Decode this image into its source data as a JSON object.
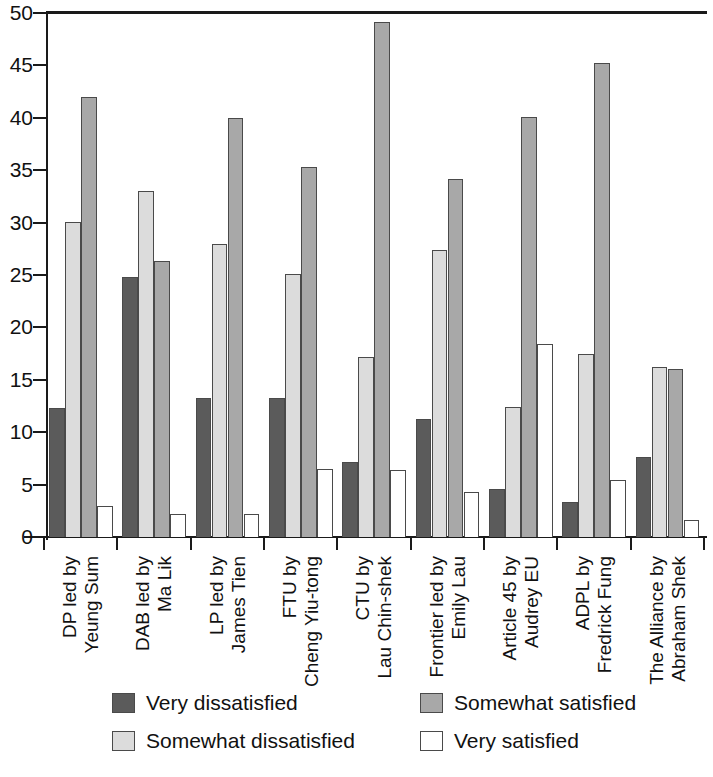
{
  "chart_data": {
    "type": "bar",
    "title": "",
    "xlabel": "",
    "ylabel": "",
    "ylim": [
      0,
      50
    ],
    "yticks": [
      0,
      5,
      10,
      15,
      20,
      25,
      30,
      35,
      40,
      45,
      50
    ],
    "grid": false,
    "legend_position": "bottom",
    "categories": [
      "DP led by\nYeung Sum",
      "DAB led by\nMa Lik",
      "LP led by\nJames Tien",
      "FTU by\nCheng Yiu-tong",
      "CTU by\nLau Chin-shek",
      "Frontier led by\nEmily Lau",
      "Article 45 by\nAudrey EU",
      "ADPL by\nFredrick Fung",
      "The Alliance by\nAbraham Shek"
    ],
    "series": [
      {
        "name": "Very dissatisfied",
        "color": "#5b5b5b",
        "values": [
          12.3,
          24.8,
          13.3,
          13.3,
          7.2,
          11.3,
          4.6,
          3.3,
          7.6
        ]
      },
      {
        "name": "Somewhat dissatisfied",
        "color": "#dcdcdc",
        "values": [
          30.1,
          33.0,
          28.0,
          25.1,
          17.2,
          27.4,
          12.4,
          17.5,
          16.2
        ]
      },
      {
        "name": "Somewhat satisfied",
        "color": "#a8a8a8",
        "values": [
          42.0,
          26.3,
          40.0,
          35.3,
          49.1,
          34.2,
          40.1,
          45.2,
          16.0
        ]
      },
      {
        "name": "Very satisfied",
        "color": "#ffffff",
        "values": [
          3.0,
          2.2,
          2.2,
          6.5,
          6.4,
          4.3,
          18.4,
          5.4,
          1.6
        ]
      }
    ]
  },
  "legend": {
    "items": [
      {
        "label": "Very dissatisfied",
        "color": "#5b5b5b"
      },
      {
        "label": "Somewhat satisfied",
        "color": "#a8a8a8"
      },
      {
        "label": "Somewhat dissatisfied",
        "color": "#dcdcdc"
      },
      {
        "label": "Very satisfied",
        "color": "#ffffff"
      }
    ]
  }
}
